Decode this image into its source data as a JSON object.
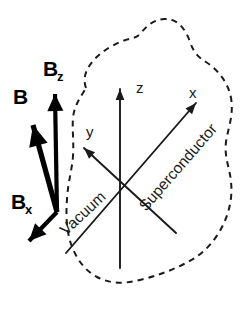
{
  "figure": {
    "background_color": "#ffffff",
    "ink_color": "#1a1a1a",
    "vector_color": "#000000",
    "width": 244,
    "height": 315
  },
  "axes": {
    "origin": {
      "x": 120,
      "y": 180
    },
    "items": [
      {
        "id": "z",
        "label": "z",
        "label_x": 136,
        "label_y": 93,
        "line": {
          "x1": 120,
          "y1": 268,
          "x2": 120,
          "y2": 89
        },
        "arrow_at": "end",
        "arrow_angle_deg": -90
      },
      {
        "id": "y",
        "label": "y",
        "label_x": 86,
        "label_y": 137,
        "line": {
          "x1": 176,
          "y1": 233,
          "x2": 84,
          "y2": 148
        },
        "arrow_at": "end",
        "arrow_angle_deg": -137
      },
      {
        "id": "x",
        "label": "x",
        "label_x": 189,
        "label_y": 98,
        "line": {
          "x1": 66,
          "y1": 253,
          "x2": 196,
          "y2": 103
        },
        "arrow_at": "end",
        "arrow_angle_deg": -49
      }
    ]
  },
  "regions": [
    {
      "id": "vacuum",
      "label": "Vacuum",
      "x": 66,
      "y": 236,
      "rotation_deg": -43
    },
    {
      "id": "superconductor",
      "label": "Superconductor",
      "x": 146,
      "y": 212,
      "rotation_deg": -49
    }
  ],
  "vectors": [
    {
      "id": "B",
      "label": "B",
      "subscript": "",
      "label_x": 13,
      "label_y": 104,
      "line": {
        "x1": 57,
        "y1": 212,
        "x2": 33,
        "y2": 125
      },
      "arrow_angle_deg": -105
    },
    {
      "id": "Bz",
      "label": "B",
      "subscript": "z",
      "label_x": 43,
      "label_y": 76,
      "line": {
        "x1": 57,
        "y1": 212,
        "x2": 55,
        "y2": 94
      },
      "arrow_angle_deg": -91
    },
    {
      "id": "Bx",
      "label": "B",
      "subscript": "x",
      "label_x": 11,
      "label_y": 209,
      "line": {
        "x1": 57,
        "y1": 212,
        "x2": 29,
        "y2": 241
      },
      "arrow_angle_deg": 134
    }
  ],
  "boundary": {
    "id": "superconductor-boundary",
    "style": "dashed",
    "path": "M 86 88 C 80 72, 94 56, 112 46 C 128 37, 134 40, 140 34 C 146 27, 152 20, 164 19 C 178 18, 186 30, 190 42 C 194 53, 198 57, 206 62 C 218 70, 228 82, 231 98 C 234 115, 228 128, 226 142 C 224 158, 230 168, 231 182 C 233 200, 228 218, 218 234 C 208 250, 196 258, 184 264 C 170 271, 156 276, 140 280 C 124 284, 110 284, 97 277 C 84 270, 76 258, 71 244 C 66 229, 66 214, 67 199 C 68 182, 72 170, 73 156 C 74 140, 72 130, 73 118 C 74 106, 80 98, 86 88 Z"
  }
}
